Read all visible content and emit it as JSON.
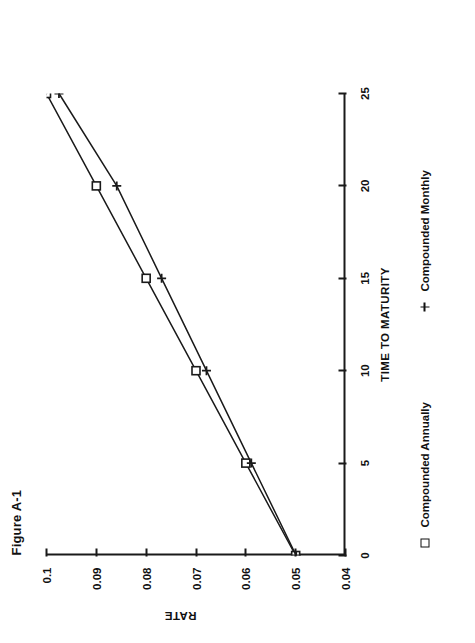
{
  "figure": {
    "title": "Figure A-1"
  },
  "axes": {
    "x_title": "TIME TO MATURITY",
    "y_title": "RATE",
    "x_ticks": [
      "0",
      "5",
      "10",
      "15",
      "20",
      "25"
    ],
    "y_ticks": [
      "0.04",
      "0.05",
      "0.06",
      "0.07",
      "0.08",
      "0.09",
      "0.1"
    ]
  },
  "legend": {
    "annual_marker": "square-marker-icon",
    "annual_label": "Compounded Annually",
    "monthly_marker": "plus-marker-icon",
    "monthly_label": "Compounded Monthly"
  },
  "chart_data": {
    "type": "line",
    "title": "Figure A-1",
    "xlabel": "TIME TO MATURITY",
    "ylabel": "RATE",
    "xlim": [
      0,
      25
    ],
    "ylim": [
      0.04,
      0.1
    ],
    "xticks": [
      0,
      5,
      10,
      15,
      20,
      25
    ],
    "yticks": [
      0.04,
      0.05,
      0.06,
      0.07,
      0.08,
      0.09,
      0.1
    ],
    "grid": false,
    "legend_position": "below-axes",
    "x": [
      0,
      5,
      10,
      15,
      20,
      25
    ],
    "series": [
      {
        "name": "Compounded Annually",
        "marker": "square",
        "values": [
          0.05,
          0.06,
          0.07,
          0.08,
          0.09,
          0.1
        ]
      },
      {
        "name": "Compounded Monthly",
        "marker": "plus",
        "values": [
          0.0499,
          0.0589,
          0.0679,
          0.0769,
          0.0859,
          0.0975
        ]
      }
    ]
  }
}
